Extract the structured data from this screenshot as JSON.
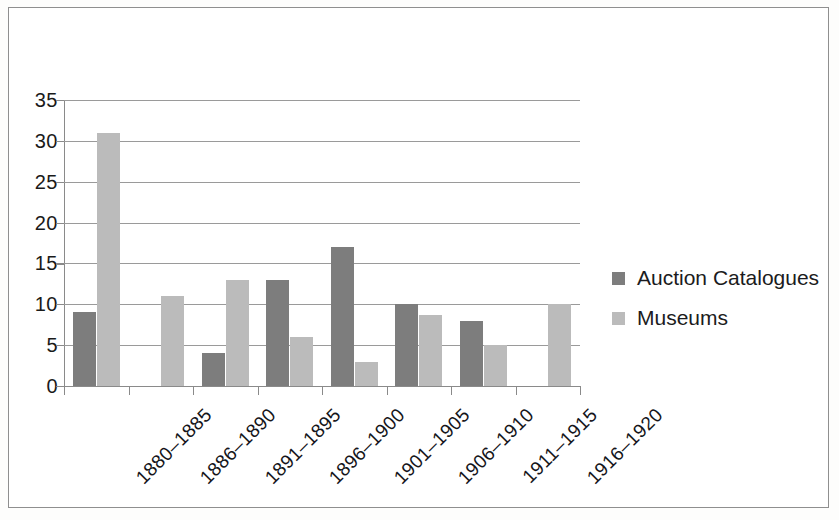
{
  "chart_data": {
    "type": "bar",
    "title": "",
    "subtitle": "",
    "xlabel": "",
    "ylabel": "",
    "ylim": [
      0,
      35
    ],
    "yticks": [
      0,
      5,
      10,
      15,
      20,
      25,
      30,
      35
    ],
    "ytick_labels": [
      "0",
      "5",
      "10",
      "15",
      "20",
      "25",
      "30",
      "35"
    ],
    "grid": "horizontal",
    "legend_position": "right",
    "categories": [
      "1880–1885",
      "1886–1890",
      "1891–1895",
      "1896–1900",
      "1901–1905",
      "1906–1910",
      "1911–1915",
      "1916–1920"
    ],
    "series": [
      {
        "name": "Auction Catalogues",
        "color": "#7d7d7d",
        "values": [
          9,
          0,
          4,
          13,
          17,
          10,
          8,
          0
        ]
      },
      {
        "name": "Museums",
        "color": "#bbbbbb",
        "values": [
          31,
          11,
          13,
          6,
          3,
          8.7,
          5,
          10
        ]
      }
    ]
  },
  "legend": {
    "items": [
      {
        "label": "Auction Catalogues",
        "color": "#7d7d7d",
        "swatch_name": "legend-swatch-auction-catalogues"
      },
      {
        "label": "Museums",
        "color": "#bbbbbb",
        "swatch_name": "legend-swatch-museums"
      }
    ]
  }
}
